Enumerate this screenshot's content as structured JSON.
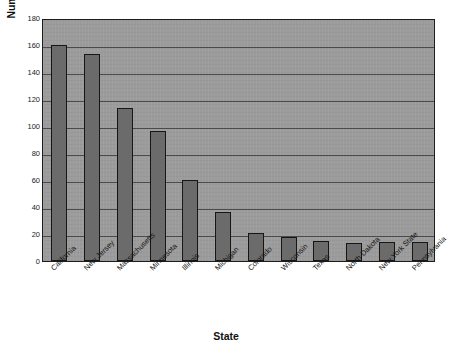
{
  "chart_data": {
    "type": "bar",
    "title": "",
    "xlabel": "State",
    "ylabel": "Number of Observed Enacted Regulations",
    "categories": [
      "California",
      "New Jersey",
      "Massachusetts",
      "Minnesota",
      "Illinois",
      "Michigan",
      "Colorado",
      "Wisconsin",
      "Texas",
      "North Dakota",
      "New York State",
      "Pennsylvania"
    ],
    "values": [
      160,
      153,
      113,
      96,
      60,
      36,
      21,
      18,
      15,
      13,
      14,
      14
    ],
    "ylim": [
      0,
      180
    ],
    "ytick_labels": [
      "180",
      "160",
      "140",
      "120",
      "100",
      "80",
      "60",
      "40",
      "20",
      "0"
    ],
    "ytick_values": [
      180,
      160,
      140,
      120,
      100,
      80,
      60,
      40,
      20,
      0
    ],
    "ytick_step": 20,
    "grid": true,
    "legend": false,
    "legend_position": "none",
    "bar_color": "#6b6b6b",
    "bar_edge_color": "#161616",
    "plot_background_color": "#9b9b9b",
    "gridline_color": "#4a4a4a",
    "figure_background_color": "#ffffff",
    "xtick_label_rotation": 45
  }
}
